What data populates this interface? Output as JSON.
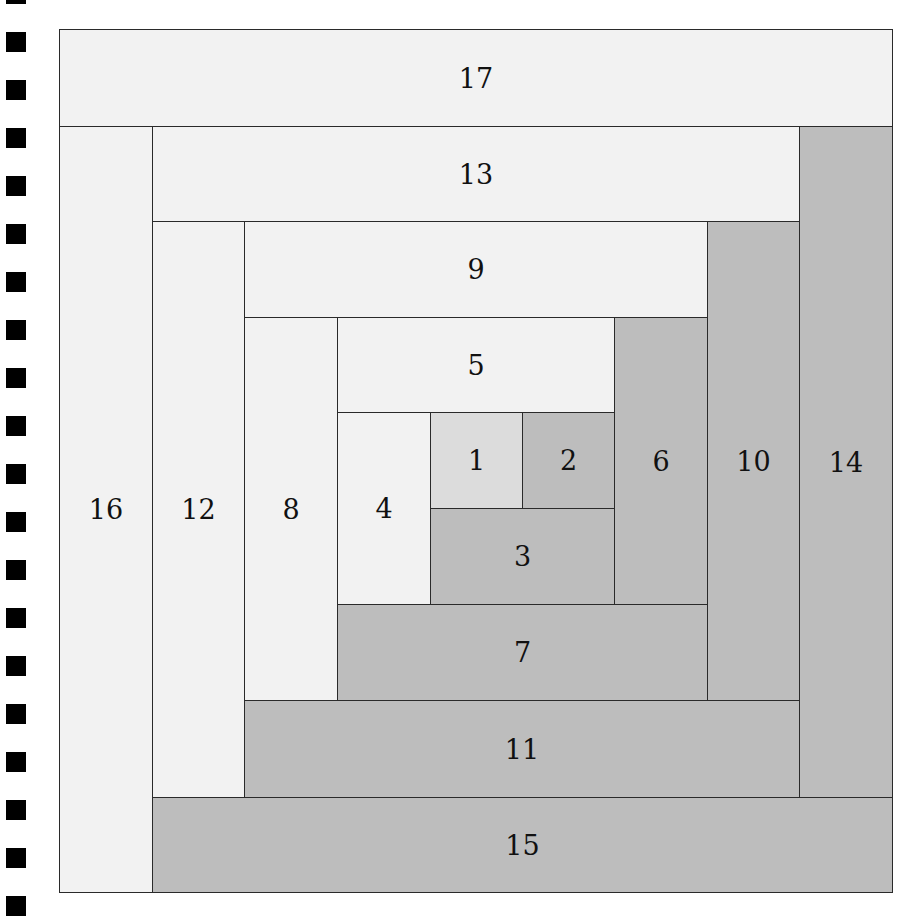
{
  "diagram": {
    "colors": {
      "light": "#f2f2f2",
      "center": "#dcdcdc",
      "dark": "#bdbdbd",
      "line": "#2a2a2a"
    },
    "pieces": [
      {
        "label": "1",
        "shade": "center",
        "x": 430,
        "y": 412,
        "w": 92,
        "h": 96
      },
      {
        "label": "2",
        "shade": "dark",
        "x": 522,
        "y": 412,
        "w": 92,
        "h": 96
      },
      {
        "label": "3",
        "shade": "dark",
        "x": 430,
        "y": 508,
        "w": 184,
        "h": 96
      },
      {
        "label": "4",
        "shade": "light",
        "x": 337,
        "y": 412,
        "w": 93,
        "h": 192
      },
      {
        "label": "5",
        "shade": "light",
        "x": 337,
        "y": 317,
        "w": 277,
        "h": 95
      },
      {
        "label": "6",
        "shade": "dark",
        "x": 614,
        "y": 317,
        "w": 93,
        "h": 287
      },
      {
        "label": "7",
        "shade": "dark",
        "x": 337,
        "y": 604,
        "w": 370,
        "h": 96
      },
      {
        "label": "8",
        "shade": "light",
        "x": 244,
        "y": 317,
        "w": 93,
        "h": 383
      },
      {
        "label": "9",
        "shade": "light",
        "x": 244,
        "y": 221,
        "w": 463,
        "h": 96
      },
      {
        "label": "10",
        "shade": "dark",
        "x": 707,
        "y": 221,
        "w": 92,
        "h": 479
      },
      {
        "label": "11",
        "shade": "dark",
        "x": 244,
        "y": 700,
        "w": 555,
        "h": 97
      },
      {
        "label": "12",
        "shade": "light",
        "x": 152,
        "y": 221,
        "w": 92,
        "h": 576
      },
      {
        "label": "13",
        "shade": "light",
        "x": 152,
        "y": 126,
        "w": 647,
        "h": 95
      },
      {
        "label": "14",
        "shade": "dark",
        "x": 799,
        "y": 126,
        "w": 93,
        "h": 671
      },
      {
        "label": "15",
        "shade": "dark",
        "x": 152,
        "y": 797,
        "w": 740,
        "h": 95
      },
      {
        "label": "16",
        "shade": "light",
        "x": 59,
        "y": 126,
        "w": 93,
        "h": 766
      },
      {
        "label": "17",
        "shade": "light",
        "x": 59,
        "y": 29,
        "w": 833,
        "h": 97
      }
    ]
  },
  "binding_markers": {
    "count": 20,
    "x": 6,
    "size": 20,
    "start_y": -16,
    "period": 48
  }
}
